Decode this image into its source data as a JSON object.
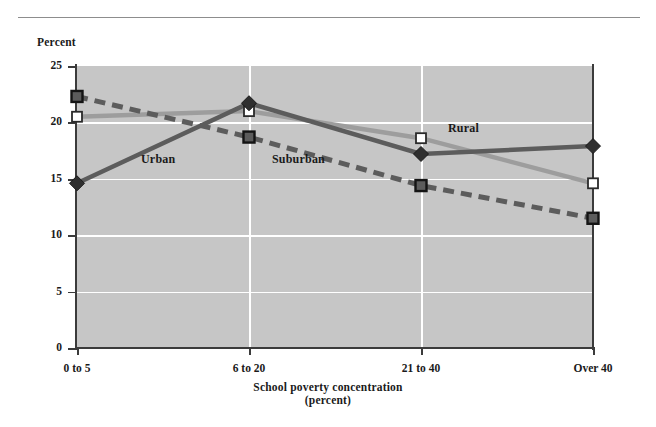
{
  "figure": {
    "percent_label": "Percent",
    "x_axis_title_line1": "School poverty concentration",
    "x_axis_title_line2": "(percent)"
  },
  "chart_data": {
    "type": "line",
    "title": "",
    "xlabel": "School poverty concentration (percent)",
    "ylabel": "Percent",
    "categories": [
      "0 to 5",
      "6 to 20",
      "21 to 40",
      "Over 40"
    ],
    "ylim": [
      0,
      25
    ],
    "yticks": [
      0,
      5,
      10,
      15,
      20,
      25
    ],
    "ytick_labels": [
      "0",
      "5",
      "10",
      "15",
      "20",
      "25"
    ],
    "grid": "horizontal-and-vertical-white",
    "legend_position": "inline-annotations",
    "series": [
      {
        "name": "Urban",
        "values": [
          14.6,
          21.7,
          17.2,
          17.9
        ],
        "color": "#5c5c5c",
        "style": "solid",
        "marker": "diamond-filled"
      },
      {
        "name": "Suburban",
        "values": [
          20.5,
          21.0,
          18.6,
          14.6
        ],
        "color": "#9d9d9d",
        "style": "solid",
        "marker": "square-open"
      },
      {
        "name": "Rural",
        "values": [
          22.3,
          18.7,
          14.4,
          11.5
        ],
        "color": "#5c5c5c",
        "style": "dashed",
        "marker": "square-filled"
      }
    ]
  },
  "annotations": [
    {
      "label": "Urban"
    },
    {
      "label": "Rural"
    },
    {
      "label": "Suburban"
    }
  ],
  "colors": {
    "plot_background": "#c6c6c6",
    "gridline": "#ffffff",
    "axis": "#3b3b3b",
    "dark_series": "#5c5c5c",
    "light_series": "#9d9d9d",
    "text": "#1a1a1a",
    "top_rule": "#8d8d8d"
  }
}
